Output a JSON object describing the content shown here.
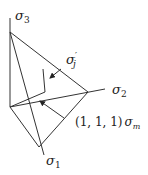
{
  "diagram": {
    "axes": [
      {
        "id": "sigma3",
        "symbol": "σ",
        "subscript": "3"
      },
      {
        "id": "sigma2",
        "symbol": "σ",
        "subscript": "2"
      },
      {
        "id": "sigma1",
        "symbol": "σ",
        "subscript": "1"
      }
    ],
    "labels": {
      "deviatoric": {
        "symbol": "σ",
        "prime": "′",
        "subscript": "j"
      },
      "hydrostatic": {
        "prefix": "(1, 1, 1)",
        "symbol": "σ",
        "subscript": "m"
      }
    },
    "colors": {
      "line": "#333333",
      "text": "#222222",
      "background": "#ffffff"
    }
  }
}
